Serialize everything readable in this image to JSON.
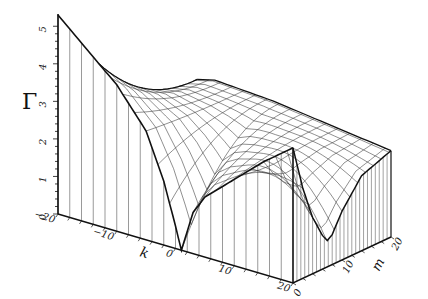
{
  "chart_data": {
    "type": "surface3d",
    "title": "",
    "zlabel": "Γ",
    "xlabel": "k",
    "ylabel": "m",
    "x_axis": {
      "name": "k",
      "ticks": [
        -20,
        -10,
        0,
        10,
        20
      ],
      "range": [
        -20,
        20
      ]
    },
    "y_axis": {
      "name": "m",
      "ticks": [
        0,
        10,
        20
      ],
      "range": [
        0,
        20
      ]
    },
    "z_axis": {
      "name": "Γ",
      "ticks": [
        0,
        1,
        2,
        3,
        4,
        5
      ],
      "range": [
        0,
        5.3
      ]
    },
    "grid": false,
    "legend": null,
    "front_edge_m0": {
      "k": [
        -20,
        -15,
        -10,
        -5,
        -2,
        0,
        1,
        3,
        5,
        10,
        15,
        20
      ],
      "gamma": [
        5.3,
        4.6,
        3.9,
        2.9,
        1.7,
        0.6,
        0.0,
        1.1,
        1.6,
        2.3,
        3.0,
        3.6
      ]
    },
    "right_edge_k20": {
      "m": [
        0,
        2,
        4,
        6,
        7,
        8,
        10,
        14,
        20
      ],
      "gamma": [
        3.6,
        2.4,
        1.5,
        0.9,
        0.7,
        0.8,
        1.3,
        2.0,
        2.3
      ]
    },
    "back_edge_m20": {
      "k": [
        -20,
        -10,
        0,
        10,
        20
      ],
      "gamma": [
        2.4,
        2.8,
        2.7,
        2.5,
        2.3
      ]
    }
  },
  "axes": {
    "z_title": "Γ",
    "z_ticks": [
      "0",
      "1",
      "2",
      "3",
      "4",
      "5"
    ],
    "k_title": "k",
    "k_ticks": [
      "−20",
      "−10",
      "0",
      "10",
      "20"
    ],
    "m_title": "m",
    "m_ticks": [
      "0",
      "10",
      "20"
    ]
  },
  "colors": {
    "line": "#111111",
    "hatch": "#555555",
    "mesh": "#333333",
    "background": "#ffffff"
  }
}
